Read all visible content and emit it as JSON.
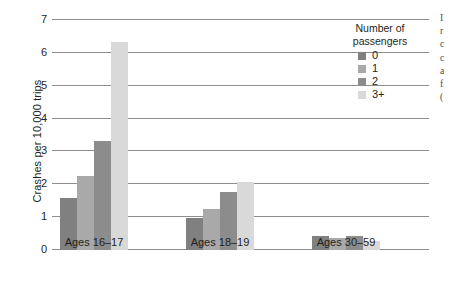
{
  "chart_data": {
    "type": "bar",
    "title": "",
    "xlabel": "",
    "ylabel": "Crashes per 10,000 trips",
    "categories": [
      "Ages 16–17",
      "Ages 18–19",
      "Ages 30–59"
    ],
    "series": [
      {
        "name": "0",
        "color": "#808080",
        "values": [
          1.58,
          0.97,
          0.43
        ]
      },
      {
        "name": "1",
        "color": "#a9a9a9",
        "values": [
          2.25,
          1.25,
          0.37
        ]
      },
      {
        "name": "2",
        "color": "#8c8c8c",
        "values": [
          3.32,
          1.77,
          0.43
        ]
      },
      {
        "name": "3+",
        "color": "#d9d9d9",
        "values": [
          6.33,
          2.07,
          0.28
        ]
      }
    ],
    "ylim": [
      0,
      7
    ],
    "yticks": [
      0,
      1,
      2,
      3,
      4,
      5,
      6,
      7
    ],
    "ytick_labels": [
      "0",
      "1",
      "2",
      "3",
      "4",
      "5",
      "6",
      "7"
    ],
    "grid": true,
    "legend_position": "top-right"
  },
  "legend": {
    "title_line1": "Number of",
    "title_line2": "passengers",
    "entries": [
      {
        "label": "0",
        "color": "#808080"
      },
      {
        "label": "1",
        "color": "#a9a9a9"
      },
      {
        "label": "2",
        "color": "#8c8c8c"
      },
      {
        "label": "3+",
        "color": "#d9d9d9"
      }
    ]
  },
  "edge_text": {
    "lines": [
      "I",
      "r",
      "c",
      "c",
      "a",
      "f",
      "("
    ]
  }
}
